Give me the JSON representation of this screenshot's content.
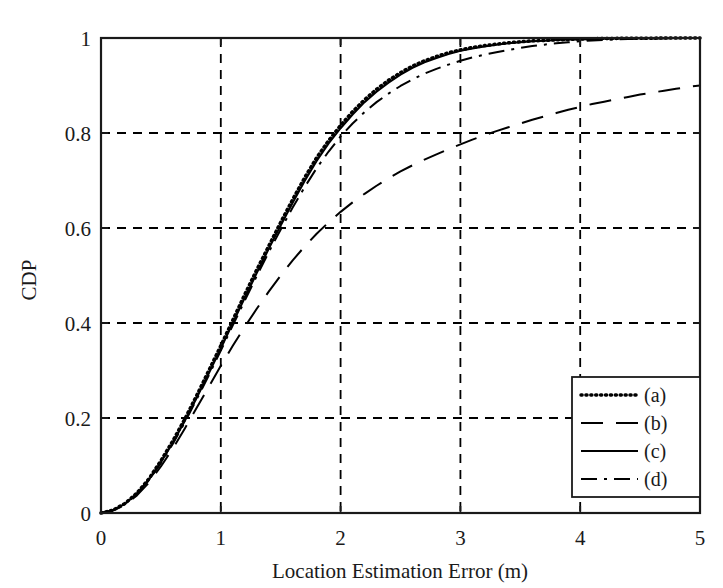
{
  "chart_data": {
    "type": "line",
    "title": "",
    "subtitle": "",
    "xlabel": "Location Estimation Error (m)",
    "ylabel": "CDP",
    "xlim": [
      0,
      5
    ],
    "ylim": [
      0,
      1
    ],
    "grid": true,
    "grid_style": "dashed",
    "xticks": [
      "0",
      "1",
      "2",
      "3",
      "4",
      "5"
    ],
    "xtick_values": [
      0,
      1,
      2,
      3,
      4,
      5
    ],
    "yticks": [
      "0",
      "0.2",
      "0.4",
      "0.6",
      "0.8",
      "1"
    ],
    "ytick_values": [
      0,
      0.2,
      0.4,
      0.6,
      0.8,
      1
    ],
    "legend_position": "lower right",
    "x": [
      0,
      0.1,
      0.2,
      0.3,
      0.4,
      0.5,
      0.6,
      0.7,
      0.8,
      0.9,
      1.0,
      1.1,
      1.2,
      1.3,
      1.4,
      1.5,
      1.6,
      1.7,
      1.8,
      1.9,
      2.0,
      2.1,
      2.2,
      2.3,
      2.4,
      2.5,
      2.6,
      2.7,
      2.8,
      2.9,
      3.0,
      3.1,
      3.2,
      3.3,
      3.4,
      3.5,
      3.6,
      3.7,
      3.8,
      3.9,
      4.0,
      4.1,
      4.2,
      4.3,
      4.4,
      4.5,
      4.6,
      4.7,
      4.8,
      4.9,
      5.0
    ],
    "series": [
      {
        "name": "(a)",
        "label": "(a)",
        "style": "dotted",
        "color": "#000000",
        "values": [
          0.0,
          0.006,
          0.02,
          0.042,
          0.072,
          0.11,
          0.152,
          0.198,
          0.248,
          0.3,
          0.352,
          0.406,
          0.46,
          0.512,
          0.562,
          0.612,
          0.66,
          0.706,
          0.748,
          0.784,
          0.816,
          0.845,
          0.87,
          0.892,
          0.911,
          0.927,
          0.941,
          0.952,
          0.961,
          0.969,
          0.975,
          0.98,
          0.984,
          0.987,
          0.99,
          0.992,
          0.994,
          0.995,
          0.996,
          0.997,
          0.998,
          0.9985,
          0.999,
          0.9992,
          0.9994,
          0.9996,
          0.9997,
          0.9998,
          0.9999,
          0.9999,
          1.0
        ]
      },
      {
        "name": "(b)",
        "label": "(b)",
        "style": "dashed",
        "color": "#000000",
        "values": [
          0.0,
          0.005,
          0.017,
          0.037,
          0.064,
          0.098,
          0.136,
          0.178,
          0.222,
          0.266,
          0.31,
          0.352,
          0.392,
          0.43,
          0.466,
          0.5,
          0.532,
          0.561,
          0.588,
          0.612,
          0.634,
          0.654,
          0.672,
          0.689,
          0.705,
          0.719,
          0.732,
          0.744,
          0.755,
          0.766,
          0.776,
          0.786,
          0.795,
          0.804,
          0.812,
          0.82,
          0.828,
          0.835,
          0.842,
          0.849,
          0.855,
          0.861,
          0.866,
          0.871,
          0.876,
          0.881,
          0.885,
          0.889,
          0.893,
          0.897,
          0.9
        ]
      },
      {
        "name": "(c)",
        "label": "(c)",
        "style": "solid",
        "color": "#000000",
        "values": [
          0.0,
          0.006,
          0.019,
          0.041,
          0.07,
          0.107,
          0.148,
          0.194,
          0.243,
          0.294,
          0.346,
          0.4,
          0.453,
          0.505,
          0.556,
          0.605,
          0.653,
          0.699,
          0.741,
          0.778,
          0.81,
          0.839,
          0.865,
          0.887,
          0.906,
          0.923,
          0.937,
          0.949,
          0.958,
          0.966,
          0.973,
          0.978,
          0.982,
          0.986,
          0.989,
          0.991,
          0.993,
          0.994,
          0.996,
          0.997,
          0.997,
          0.998,
          0.9985,
          0.999,
          0.9992,
          0.9994,
          0.9996,
          0.9997,
          0.9998,
          0.9999,
          1.0
        ]
      },
      {
        "name": "(d)",
        "label": "(d)",
        "style": "dashdot",
        "color": "#000000",
        "values": [
          0.0,
          0.006,
          0.019,
          0.04,
          0.069,
          0.105,
          0.146,
          0.191,
          0.24,
          0.29,
          0.342,
          0.395,
          0.447,
          0.499,
          0.549,
          0.597,
          0.643,
          0.686,
          0.726,
          0.761,
          0.793,
          0.82,
          0.844,
          0.865,
          0.883,
          0.899,
          0.913,
          0.925,
          0.935,
          0.944,
          0.952,
          0.959,
          0.965,
          0.97,
          0.975,
          0.979,
          0.983,
          0.986,
          0.989,
          0.991,
          0.993,
          0.995,
          0.996,
          0.997,
          0.998,
          0.9985,
          0.999,
          0.9993,
          0.9996,
          0.9998,
          1.0
        ]
      }
    ],
    "annotations": []
  },
  "legend": {
    "items": [
      {
        "label": "(a)",
        "style": "dotted"
      },
      {
        "label": "(b)",
        "style": "dashed"
      },
      {
        "label": "(c)",
        "style": "solid"
      },
      {
        "label": "(d)",
        "style": "dashdot"
      }
    ]
  },
  "colors": {
    "axis": "#1a1a1a",
    "grid": "#000000",
    "curve": "#000000",
    "background": "#ffffff"
  }
}
